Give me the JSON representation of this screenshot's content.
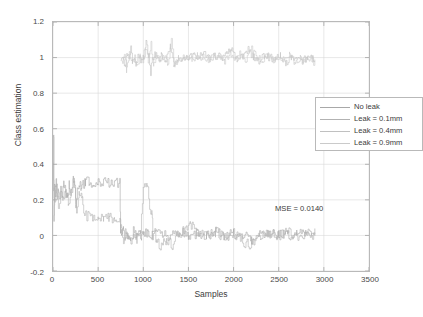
{
  "chart_data": {
    "type": "line",
    "title": "",
    "xlabel": "Samples",
    "ylabel": "Class estimation",
    "xlim": [
      0,
      3500
    ],
    "ylim": [
      -0.2,
      1.2
    ],
    "xticks": [
      0,
      500,
      1000,
      1500,
      2000,
      2500,
      3000,
      3500
    ],
    "yticks": [
      -0.2,
      0,
      0.2,
      0.4,
      0.6,
      0.8,
      1,
      1.2
    ],
    "xtick_labels": [
      "0",
      "500",
      "1000",
      "1500",
      "2000",
      "2500",
      "3000",
      "3500"
    ],
    "ytick_labels": [
      "-0.2",
      "0",
      "0.2",
      "0.4",
      "0.6",
      "0.8",
      "1",
      "1.2"
    ],
    "grid": true,
    "legend_position": "upper right inside",
    "annotations": [
      {
        "text": "MSE = 0.0140",
        "x": 1950,
        "y": 0.26
      }
    ],
    "series": [
      {
        "name": "No leak",
        "color": "#a8a8a8",
        "points": [
          [
            5,
            0.25
          ],
          [
            8,
            0.58
          ],
          [
            12,
            0.1
          ],
          [
            18,
            0.27
          ],
          [
            26,
            0.24
          ],
          [
            34,
            0.3
          ],
          [
            45,
            0.22
          ],
          [
            58,
            0.27
          ],
          [
            70,
            0.2
          ],
          [
            85,
            0.26
          ],
          [
            100,
            0.23
          ],
          [
            120,
            0.29
          ],
          [
            140,
            0.24
          ],
          [
            160,
            0.21
          ],
          [
            180,
            0.28
          ],
          [
            200,
            0.25
          ],
          [
            225,
            0.31
          ],
          [
            250,
            0.18
          ],
          [
            270,
            0.27
          ],
          [
            290,
            0.3
          ],
          [
            310,
            0.26
          ],
          [
            330,
            0.29
          ],
          [
            360,
            0.3
          ],
          [
            400,
            0.3
          ],
          [
            450,
            0.3
          ],
          [
            500,
            0.3
          ],
          [
            560,
            0.3
          ],
          [
            620,
            0.3
          ],
          [
            680,
            0.3
          ],
          [
            740,
            0.3
          ],
          [
            748,
            0.02
          ],
          [
            760,
            -0.01
          ],
          [
            780,
            0.03
          ],
          [
            800,
            -0.02
          ],
          [
            830,
            0.01
          ],
          [
            860,
            -0.03
          ],
          [
            890,
            0.02
          ],
          [
            920,
            0.0
          ],
          [
            950,
            0.01
          ],
          [
            980,
            -0.01
          ],
          [
            1000,
            0.0
          ],
          [
            1050,
            0.02
          ],
          [
            1100,
            0.0
          ],
          [
            1200,
            0.01
          ],
          [
            1300,
            -0.01
          ],
          [
            1400,
            0.02
          ],
          [
            1500,
            0.0
          ],
          [
            1600,
            0.01
          ],
          [
            1700,
            0.0
          ],
          [
            1800,
            0.02
          ],
          [
            1900,
            -0.01
          ],
          [
            2000,
            0.01
          ],
          [
            2100,
            0.0
          ],
          [
            2200,
            -0.02
          ],
          [
            2300,
            0.01
          ],
          [
            2400,
            0.0
          ],
          [
            2500,
            0.01
          ],
          [
            2600,
            0.0
          ],
          [
            2700,
            0.01
          ],
          [
            2800,
            0.0
          ],
          [
            2900,
            0.01
          ]
        ]
      },
      {
        "name": "Leak = 0.1mm",
        "color": "#b2b2b2",
        "points": [
          [
            5,
            0.24
          ],
          [
            20,
            0.2
          ],
          [
            40,
            0.26
          ],
          [
            60,
            0.18
          ],
          [
            85,
            0.24
          ],
          [
            110,
            0.21
          ],
          [
            140,
            0.27
          ],
          [
            170,
            0.19
          ],
          [
            200,
            0.23
          ],
          [
            230,
            0.32
          ],
          [
            260,
            0.15
          ],
          [
            290,
            0.24
          ],
          [
            320,
            0.22
          ],
          [
            350,
            0.12
          ],
          [
            400,
            0.1
          ],
          [
            450,
            0.1
          ],
          [
            500,
            0.1
          ],
          [
            560,
            0.1
          ],
          [
            620,
            0.1
          ],
          [
            680,
            0.1
          ],
          [
            740,
            0.1
          ],
          [
            750,
            0.04
          ],
          [
            780,
            -0.02
          ],
          [
            810,
            0.03
          ],
          [
            850,
            -0.04
          ],
          [
            890,
            0.01
          ],
          [
            930,
            -0.02
          ],
          [
            970,
            0.02
          ],
          [
            1000,
            0.3
          ],
          [
            1040,
            0.3
          ],
          [
            1070,
            0.15
          ],
          [
            1095,
            0.12
          ],
          [
            1105,
            0.05
          ],
          [
            1150,
            -0.03
          ],
          [
            1200,
            -0.06
          ],
          [
            1260,
            -0.02
          ],
          [
            1320,
            -0.05
          ],
          [
            1380,
            0.0
          ],
          [
            1450,
            0.03
          ],
          [
            1520,
            0.06
          ],
          [
            1600,
            0.02
          ],
          [
            1700,
            0.0
          ],
          [
            1800,
            0.02
          ],
          [
            1900,
            -0.01
          ],
          [
            2000,
            0.01
          ],
          [
            2100,
            -0.04
          ],
          [
            2200,
            -0.05
          ],
          [
            2300,
            0.0
          ],
          [
            2400,
            0.01
          ],
          [
            2500,
            0.0
          ],
          [
            2600,
            0.02
          ],
          [
            2700,
            0.0
          ],
          [
            2800,
            0.01
          ],
          [
            2900,
            0.0
          ]
        ]
      },
      {
        "name": "Leak = 0.4mm",
        "color": "#c0c0c0",
        "points": [
          [
            750,
            0.98
          ],
          [
            780,
            1.0
          ],
          [
            800,
            0.95
          ],
          [
            820,
            1.02
          ],
          [
            840,
            0.99
          ],
          [
            860,
            1.05
          ],
          [
            880,
            0.98
          ],
          [
            900,
            1.0
          ],
          [
            920,
            0.96
          ],
          [
            940,
            1.01
          ],
          [
            960,
            0.99
          ],
          [
            980,
            0.97
          ],
          [
            1000,
            1.0
          ],
          [
            1030,
            1.08
          ],
          [
            1060,
            1.02
          ],
          [
            1080,
            0.92
          ],
          [
            1100,
            1.0
          ],
          [
            1130,
            1.02
          ],
          [
            1160,
            0.98
          ],
          [
            1200,
            1.01
          ],
          [
            1250,
            0.99
          ],
          [
            1300,
            1.06
          ],
          [
            1340,
            0.94
          ],
          [
            1380,
            1.0
          ],
          [
            1420,
            0.98
          ],
          [
            1460,
            1.01
          ],
          [
            1500,
            0.99
          ],
          [
            1560,
            1.02
          ],
          [
            1620,
            1.0
          ],
          [
            1680,
            1.03
          ],
          [
            1740,
            0.99
          ],
          [
            1800,
            1.01
          ],
          [
            1860,
            1.0
          ],
          [
            1920,
            1.02
          ],
          [
            1980,
            1.04
          ],
          [
            2040,
            0.99
          ],
          [
            2100,
            1.01
          ],
          [
            2160,
            1.05
          ],
          [
            2220,
            1.0
          ],
          [
            2280,
            0.98
          ],
          [
            2340,
            1.01
          ],
          [
            2400,
            1.0
          ],
          [
            2460,
            0.99
          ],
          [
            2520,
            1.01
          ],
          [
            2580,
            0.97
          ],
          [
            2640,
            1.0
          ],
          [
            2700,
            0.99
          ],
          [
            2760,
            0.98
          ],
          [
            2820,
            1.0
          ],
          [
            2880,
            0.99
          ],
          [
            2900,
            1.0
          ]
        ]
      },
      {
        "name": "Leak = 0.9mm",
        "color": "#cacaca",
        "points": [
          [
            760,
            0.96
          ],
          [
            790,
            1.01
          ],
          [
            815,
            0.93
          ],
          [
            845,
            1.03
          ],
          [
            875,
            0.97
          ],
          [
            905,
            1.01
          ],
          [
            935,
            0.95
          ],
          [
            965,
            1.02
          ],
          [
            995,
            0.98
          ],
          [
            1025,
            1.04
          ],
          [
            1055,
            0.99
          ],
          [
            1085,
            1.07
          ],
          [
            1115,
            0.96
          ],
          [
            1150,
            1.01
          ],
          [
            1190,
            0.99
          ],
          [
            1230,
            1.02
          ],
          [
            1270,
            0.97
          ],
          [
            1310,
            1.09
          ],
          [
            1350,
            0.95
          ],
          [
            1390,
            1.0
          ],
          [
            1430,
            0.99
          ],
          [
            1480,
            1.02
          ],
          [
            1540,
            0.98
          ],
          [
            1600,
            1.01
          ],
          [
            1660,
            1.0
          ],
          [
            1720,
            0.99
          ],
          [
            1780,
            1.02
          ],
          [
            1840,
            1.0
          ],
          [
            1900,
            0.98
          ],
          [
            1960,
            1.03
          ],
          [
            2020,
            1.0
          ],
          [
            2080,
            1.02
          ],
          [
            2140,
            0.99
          ],
          [
            2200,
            1.06
          ],
          [
            2260,
            1.0
          ],
          [
            2320,
            0.99
          ],
          [
            2380,
            1.01
          ],
          [
            2440,
            0.98
          ],
          [
            2500,
            1.0
          ],
          [
            2560,
            0.99
          ],
          [
            2620,
            1.01
          ],
          [
            2680,
            0.97
          ],
          [
            2740,
            1.0
          ],
          [
            2800,
            0.98
          ],
          [
            2860,
            0.99
          ],
          [
            2900,
            0.97
          ]
        ]
      }
    ]
  },
  "legend": {
    "items": [
      {
        "label": "No leak"
      },
      {
        "label": "Leak = 0.1mm"
      },
      {
        "label": "Leak = 0.4mm"
      },
      {
        "label": "Leak = 0.9mm"
      }
    ]
  },
  "colors": {
    "axis": "#b9b9b9",
    "grid": "#d8d8d8",
    "text": "#3a3a3a",
    "background": "#ffffff"
  }
}
